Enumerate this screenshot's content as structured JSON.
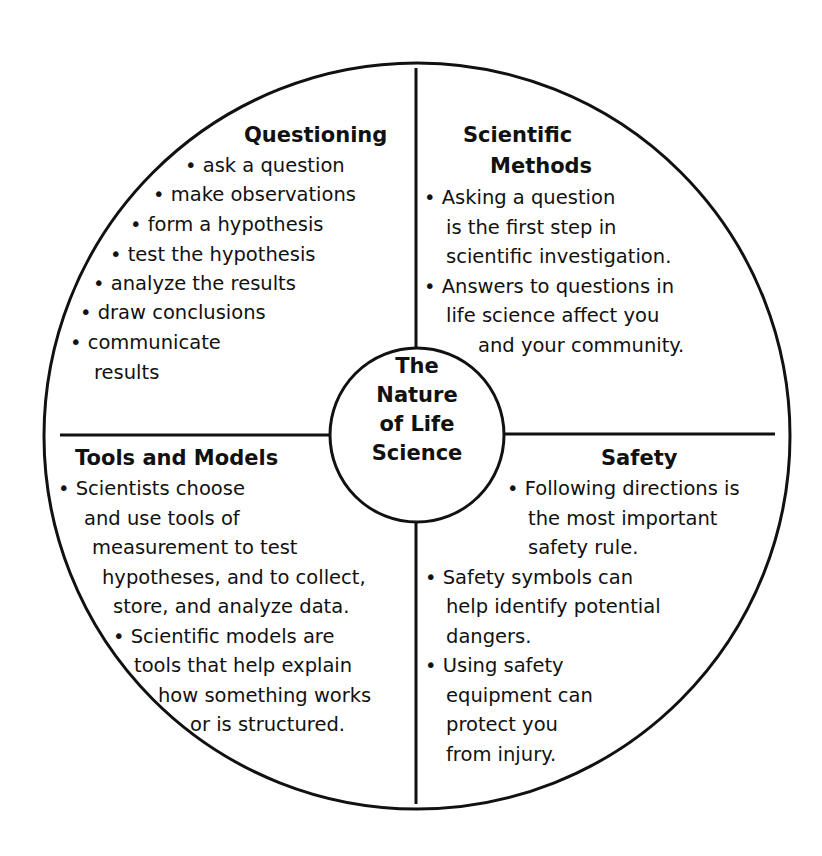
{
  "title": "The Nature of Life Science",
  "center": {
    "lines": [
      "The",
      "Nature",
      "of Life",
      "Science"
    ]
  },
  "quadrants": {
    "questioning": {
      "heading": "Questioning",
      "lines": [
        "• ask a question",
        "• make observations",
        "• form a hypothesis",
        "• test the hypothesis",
        "• analyze the results",
        "• draw conclusions",
        "• communicate",
        "results"
      ]
    },
    "scientific_methods": {
      "heading_line1": "Scientific",
      "heading_line2": "Methods",
      "lines": [
        "• Asking a question",
        "is the first step in",
        "scientific investigation.",
        "• Answers to questions in",
        "life science affect you",
        "and your community."
      ]
    },
    "tools_and_models": {
      "heading": "Tools and Models",
      "lines": [
        "• Scientists choose",
        "and use tools of",
        "measurement to test",
        "hypotheses, and to collect,",
        "store, and analyze data.",
        "• Scientific models are",
        "tools that help explain",
        "how something works",
        "or is structured."
      ]
    },
    "safety": {
      "heading": "Safety",
      "lines": [
        "• Following directions is",
        "the most important",
        "safety rule.",
        "• Safety symbols can",
        "help identify potential",
        "dangers.",
        "• Using safety",
        "equipment can",
        "protect you",
        "from injury."
      ]
    }
  },
  "colors": {
    "stroke": "#111111",
    "background": "#ffffff"
  }
}
